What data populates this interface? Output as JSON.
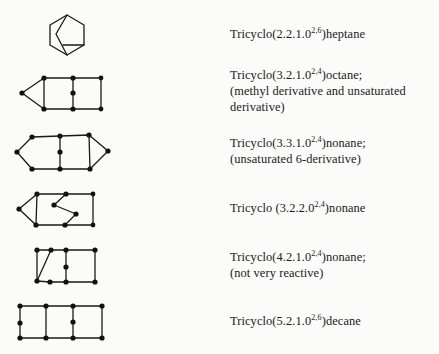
{
  "figure": {
    "entries": [
      {
        "name_prefix": "Tricyclo(2.2.1.0",
        "superscript": "2,6",
        "name_suffix": ")heptane",
        "notes": []
      },
      {
        "name_prefix": "Tricyclo(3.2.1.0",
        "superscript": "2,4",
        "name_suffix": ")octane;",
        "notes": [
          "(methyl derivative and unsaturated",
          "derivative)"
        ]
      },
      {
        "name_prefix": "Tricyclo(3.3.1.0",
        "superscript": "2,4",
        "name_suffix": ")nonane;",
        "notes": [
          "(unsaturated 6-derivative)"
        ]
      },
      {
        "name_prefix": "Tricyclo (3.2.2.0",
        "superscript": "2,4",
        "name_suffix": ")nonane",
        "notes": []
      },
      {
        "name_prefix": "Tricyclo(4.2.1.0",
        "superscript": "2,4",
        "name_suffix": ")nonane;",
        "notes": [
          "(not very reactive)"
        ]
      },
      {
        "name_prefix": "Tricyclo(5.2.1.0",
        "superscript": "2,6",
        "name_suffix": ")decane",
        "notes": []
      }
    ]
  }
}
